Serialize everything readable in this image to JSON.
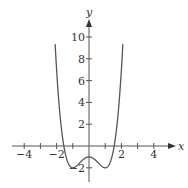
{
  "chart_data": {
    "type": "line",
    "title": "",
    "xlabel": "x",
    "ylabel": "y",
    "function": "y = x^4 - 2x^2 - 1",
    "xlim": [
      -4.9,
      5.0
    ],
    "ylim": [
      -3.2,
      12
    ],
    "x_ticks": [
      -4,
      -3,
      -2,
      -1,
      1,
      2,
      3,
      4
    ],
    "x_tick_labels": [
      "-4",
      "-2",
      "2",
      "4"
    ],
    "x_tick_label_values": [
      -4,
      -2,
      2,
      4
    ],
    "y_ticks": [
      -2,
      2,
      4,
      6,
      8,
      10
    ],
    "y_tick_labels": [
      "-2",
      "2",
      "4",
      "6",
      "8",
      "10"
    ],
    "grid": false,
    "legend": null,
    "series": [
      {
        "name": "curve",
        "color": "#555555",
        "x": [
          -2.09,
          -2.0,
          -1.8,
          -1.6,
          -1.4,
          -1.2,
          -1.0,
          -0.8,
          -0.6,
          -0.4,
          -0.2,
          0.0,
          0.2,
          0.4,
          0.6,
          0.8,
          1.0,
          1.2,
          1.4,
          1.6,
          1.8,
          2.0,
          2.09
        ],
        "values": [
          10.35,
          7.0,
          3.02,
          0.43,
          -1.08,
          -1.81,
          -2.0,
          -1.87,
          -1.59,
          -1.29,
          -1.08,
          -1.0,
          -1.08,
          -1.29,
          -1.59,
          -1.87,
          -2.0,
          -1.81,
          -1.08,
          0.43,
          3.02,
          7.0,
          10.35
        ]
      }
    ]
  },
  "axis": {
    "x_label": "x",
    "y_label": "y",
    "x_tick_texts": [
      "−4",
      "−2",
      "2",
      "4"
    ],
    "y_tick_texts": [
      "10",
      "8",
      "6",
      "4",
      "2",
      "−2"
    ]
  }
}
